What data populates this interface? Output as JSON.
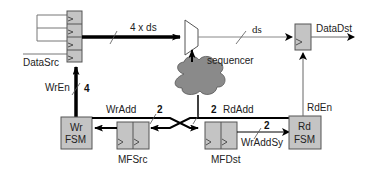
{
  "diagram": {
    "colors": {
      "box_fill": "#c4c4c4",
      "box_stroke": "#555555",
      "cloud_fill": "#8a8a8a",
      "line": "#000000",
      "thin_line": "#666666"
    },
    "blocks": {
      "data_src": {
        "label": "DataSrc",
        "cells": 4
      },
      "data_dst": {
        "label": "DataDst"
      },
      "mux": {
        "label": ""
      },
      "sequencer": {
        "label": "sequencer"
      },
      "wr_fsm": {
        "line1": "Wr",
        "line2": "FSM"
      },
      "rd_fsm": {
        "line1": "Rd",
        "line2": "FSM"
      },
      "mf_src": {
        "label": "MFSrc",
        "cells": 2
      },
      "mf_dst": {
        "label": "MFDst",
        "cells": 2
      }
    },
    "signals": {
      "wide_bus": {
        "label": "4 x ds"
      },
      "narrow_bus": {
        "label": "ds"
      },
      "wr_en": {
        "label": "WrEn",
        "width": "4"
      },
      "wr_add": {
        "label": "WrAdd",
        "width": "2"
      },
      "rd_add": {
        "label": "RdAdd",
        "width": "2"
      },
      "rd_en": {
        "label": "RdEn"
      },
      "wr_add_sy": {
        "label": "WrAddSy",
        "width": "2"
      }
    }
  }
}
